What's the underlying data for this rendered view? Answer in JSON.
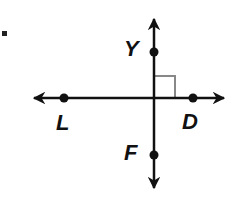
{
  "question": {
    "marker": "."
  },
  "diagram": {
    "line_color": "#111111",
    "right_angle_color": "#888888",
    "horizontal_line": {
      "name": "line LD",
      "points": [
        {
          "label": "L",
          "x": 64,
          "y": 98
        },
        {
          "label": "D",
          "x": 193,
          "y": 98
        }
      ]
    },
    "vertical_line": {
      "name": "line YF",
      "points": [
        {
          "label": "Y",
          "x": 154,
          "y": 52
        },
        {
          "label": "F",
          "x": 154,
          "y": 155
        }
      ]
    },
    "intersection": {
      "x": 154,
      "y": 98
    },
    "right_angle_mark": true
  },
  "labels": {
    "Y": "Y",
    "L": "L",
    "D": "D",
    "F": "F"
  }
}
